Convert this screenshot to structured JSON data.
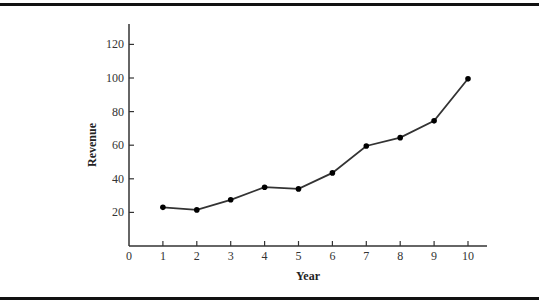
{
  "chart_data": {
    "type": "line",
    "title": "",
    "xlabel": "Year",
    "ylabel": "Revenue",
    "x": [
      1,
      2,
      3,
      4,
      5,
      6,
      7,
      8,
      9,
      10
    ],
    "series": [
      {
        "name": "Revenue",
        "values": [
          23,
          21.5,
          27.5,
          35,
          34,
          43.5,
          59.5,
          64.5,
          74.5,
          99.5
        ]
      }
    ],
    "x_ticks": [
      "0",
      "1",
      "2",
      "3",
      "4",
      "5",
      "6",
      "7",
      "8",
      "9",
      "10"
    ],
    "y_ticks": [
      "20",
      "40",
      "60",
      "80",
      "100",
      "120"
    ],
    "xlim": [
      0,
      10.5
    ],
    "ylim": [
      0,
      125
    ],
    "grid": false,
    "legend": "none",
    "markers": true,
    "line_color": "#333333",
    "marker_color": "#000000"
  }
}
